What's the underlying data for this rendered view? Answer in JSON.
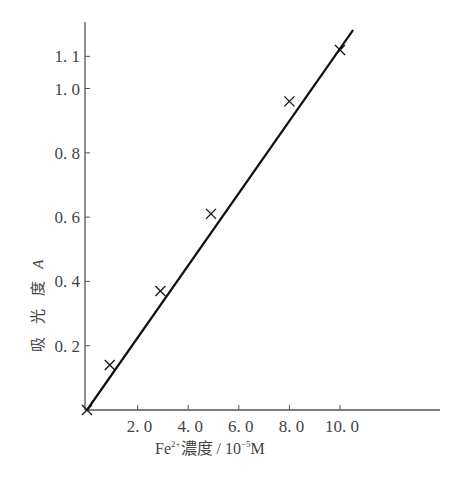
{
  "chart_data": {
    "type": "line",
    "title": "",
    "xlabel": "Fe²⁺濃度 / 10⁻⁵M",
    "ylabel": "吸光度 A",
    "x_ticks": [
      "2.0",
      "4.0",
      "6.0",
      "8.0",
      "10.0"
    ],
    "y_ticks": [
      "0.2",
      "0.4",
      "0.6",
      "0.8",
      "1.0",
      "1.1"
    ],
    "xlim": [
      0,
      14
    ],
    "ylim": [
      0,
      1.2
    ],
    "grid": false,
    "legend": null,
    "series": [
      {
        "name": "calibration",
        "marker": "x",
        "line": "straight fit through origin",
        "x": [
          0,
          0.9,
          2.9,
          4.9,
          8.0,
          10.0
        ],
        "y": [
          0.0,
          0.14,
          0.37,
          0.61,
          0.96,
          1.12
        ]
      }
    ],
    "fit_line": {
      "x": [
        0,
        10.5
      ],
      "y": [
        0.0,
        1.18
      ]
    }
  },
  "labels": {
    "ylabel_text": "吸 光 度",
    "ylabel_symbol": "A",
    "xlabel_prefix": "Fe",
    "xlabel_sup": "2+",
    "xlabel_suffix": "濃度 / 10",
    "xlabel_exp": "−5",
    "xlabel_unit": "M"
  },
  "colors": {
    "axis": "#555555",
    "line": "#111111",
    "text": "#444444"
  }
}
